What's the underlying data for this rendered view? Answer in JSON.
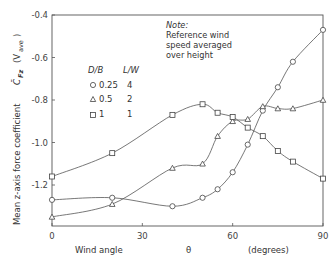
{
  "chart_data": {
    "type": "line",
    "title": "",
    "xlabel": "Wind angle θ (degrees)",
    "xlabel_parts": [
      "Wind angle",
      "θ",
      "(degrees)"
    ],
    "ylabel": "Mean z-axis force coefficient C̄Fz (Vave)",
    "ylabel_main": "Mean z-axis force coefficient",
    "ylabel_symbol": "C̄",
    "ylabel_symbol_sub": "Fz",
    "ylabel_ref": "(V",
    "ylabel_ref_sub": "ave",
    "ylabel_ref_close": ")",
    "xlim": [
      0,
      90
    ],
    "ylim": [
      -1.39,
      -0.4
    ],
    "xticks": [
      0,
      30,
      60,
      90
    ],
    "xtick_labels": [
      "0",
      "30",
      "60",
      "90"
    ],
    "yticks": [
      -0.4,
      -0.6,
      -0.8,
      -1.0,
      -1.2
    ],
    "ytick_labels": [
      "-0.4",
      "-0.6",
      "-0.8",
      "-1.0",
      "-1.2"
    ],
    "grid": false,
    "legend": {
      "position": "upper-left",
      "headers": [
        "D/B",
        "L/W"
      ],
      "entries": [
        {
          "marker": "circle",
          "db": "0.25",
          "lw": "4"
        },
        {
          "marker": "triangle",
          "db": "0.5",
          "lw": "2"
        },
        {
          "marker": "square",
          "db": "1",
          "lw": "1"
        }
      ]
    },
    "annotation": {
      "title": "Note:",
      "lines": [
        "Reference wind",
        "speed averaged",
        "over height"
      ]
    },
    "series": [
      {
        "name": "D/B=0.25, L/W=4",
        "marker": "circle",
        "x": [
          0,
          20,
          40,
          50,
          55,
          60,
          65,
          70,
          75,
          80,
          90
        ],
        "values": [
          -1.27,
          -1.26,
          -1.3,
          -1.26,
          -1.22,
          -1.14,
          -1.01,
          -0.85,
          -0.74,
          -0.62,
          -0.47
        ]
      },
      {
        "name": "D/B=0.5, L/W=2",
        "marker": "triangle",
        "x": [
          0,
          20,
          40,
          50,
          55,
          60,
          65,
          70,
          75,
          80,
          90
        ],
        "values": [
          -1.35,
          -1.29,
          -1.12,
          -1.1,
          -0.97,
          -0.9,
          -0.89,
          -0.83,
          -0.84,
          -0.84,
          -0.8
        ]
      },
      {
        "name": "D/B=1, L/W=1",
        "marker": "square",
        "x": [
          0,
          20,
          40,
          50,
          55,
          60,
          65,
          70,
          75,
          80,
          90
        ],
        "values": [
          -1.16,
          -1.05,
          -0.87,
          -0.82,
          -0.86,
          -0.88,
          -0.93,
          -0.97,
          -1.04,
          -1.09,
          -1.17
        ]
      }
    ]
  }
}
